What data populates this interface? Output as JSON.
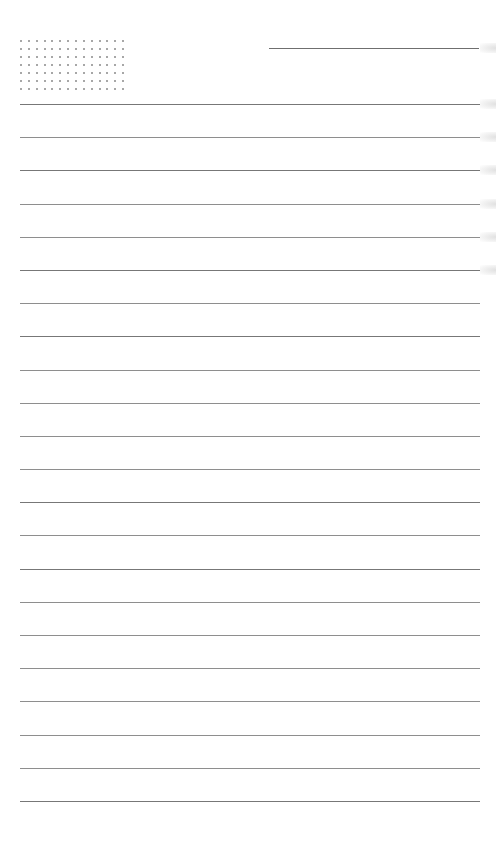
{
  "page": {
    "type": "lined-notebook-page",
    "background_color": "#ffffff",
    "line_color": "#8e8e8e",
    "dot_color": "#8a8a8a"
  },
  "header": {
    "dot_grid": {
      "columns": 14,
      "rows": 7,
      "origin_x": 21,
      "origin_y": 41,
      "spacing_x": 7.85,
      "spacing_y": 7.95
    },
    "title_line": {
      "x1": 269,
      "x2": 479,
      "y": 48
    }
  },
  "ruled_lines": {
    "count": 22,
    "first_y": 104,
    "spacing": 33.19,
    "x1": 20,
    "x2": 480,
    "shades": [
      "dark",
      "normal",
      "dark",
      "normal",
      "normal",
      "dark",
      "normal",
      "dark",
      "normal",
      "normal",
      "normal",
      "normal",
      "dark",
      "normal",
      "dark",
      "normal",
      "normal",
      "normal",
      "normal",
      "normal",
      "normal",
      "dark"
    ]
  },
  "writing": {
    "lines_text": [
      "",
      "",
      "",
      "",
      "",
      "",
      "",
      "",
      "",
      "",
      "",
      "",
      "",
      "",
      "",
      "",
      "",
      "",
      "",
      "",
      "",
      ""
    ]
  }
}
